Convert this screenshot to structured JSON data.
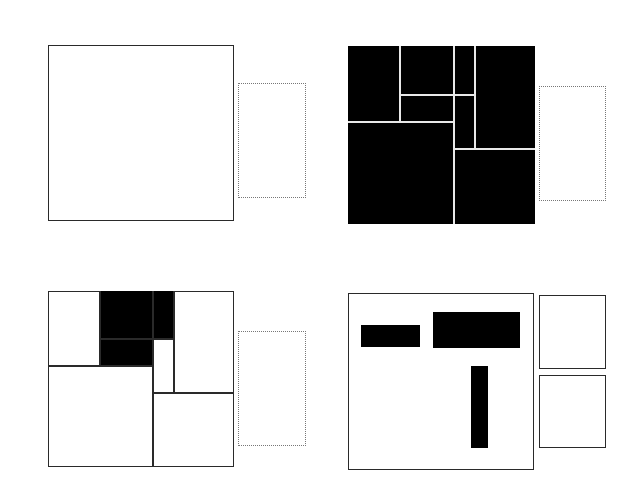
{
  "colors": {
    "background": "#ffffff",
    "stroke": "#2a2a2a",
    "fill": "#000000",
    "divider_on_black": "#e8e8e8",
    "dotted": "#777777"
  },
  "panels": [
    {
      "id": "top-left",
      "description": "empty square with dotted rectangle",
      "frame": {
        "x": 48,
        "y": 45,
        "w": 186,
        "h": 176,
        "style": "outline"
      },
      "side": [
        {
          "x": 238,
          "y": 83,
          "w": 68,
          "h": 115,
          "style": "dotted"
        }
      ]
    },
    {
      "id": "top-right",
      "description": "fully filled square partitioned into cells",
      "frame": {
        "x": 348,
        "y": 46,
        "w": 187,
        "h": 178,
        "style": "filled"
      },
      "dividers": [
        {
          "x1": 400,
          "y1": 46,
          "x2": 400,
          "y2": 122
        },
        {
          "x1": 454,
          "y1": 46,
          "x2": 454,
          "y2": 224
        },
        {
          "x1": 475,
          "y1": 46,
          "x2": 475,
          "y2": 149
        },
        {
          "x1": 400,
          "y1": 95,
          "x2": 475,
          "y2": 95
        },
        {
          "x1": 348,
          "y1": 122,
          "x2": 454,
          "y2": 122
        },
        {
          "x1": 454,
          "y1": 149,
          "x2": 535,
          "y2": 149
        }
      ],
      "side": [
        {
          "x": 539,
          "y": 86,
          "w": 67,
          "h": 115,
          "style": "dotted"
        }
      ]
    },
    {
      "id": "bottom-left",
      "description": "partitioned square with some cells filled",
      "frame": {
        "x": 48,
        "y": 291,
        "w": 186,
        "h": 176,
        "style": "outline"
      },
      "dividers": [
        {
          "x1": 100,
          "y1": 291,
          "x2": 100,
          "y2": 366
        },
        {
          "x1": 153,
          "y1": 291,
          "x2": 153,
          "y2": 467
        },
        {
          "x1": 174,
          "y1": 291,
          "x2": 174,
          "y2": 393
        },
        {
          "x1": 100,
          "y1": 339,
          "x2": 174,
          "y2": 339
        },
        {
          "x1": 48,
          "y1": 366,
          "x2": 153,
          "y2": 366
        },
        {
          "x1": 153,
          "y1": 393,
          "x2": 234,
          "y2": 393
        }
      ],
      "filled_cells": [
        {
          "x": 100,
          "y": 291,
          "w": 53,
          "h": 48
        },
        {
          "x": 153,
          "y": 291,
          "w": 21,
          "h": 48
        },
        {
          "x": 100,
          "y": 339,
          "w": 53,
          "h": 27
        }
      ],
      "side": [
        {
          "x": 238,
          "y": 331,
          "w": 68,
          "h": 115,
          "style": "dotted"
        }
      ]
    },
    {
      "id": "bottom-right",
      "description": "outline frame with three black bars and two side boxes",
      "frame": {
        "x": 348,
        "y": 293,
        "w": 186,
        "h": 177,
        "style": "outline"
      },
      "bars": [
        {
          "x": 361,
          "y": 325,
          "w": 59,
          "h": 22
        },
        {
          "x": 433,
          "y": 312,
          "w": 87,
          "h": 36
        },
        {
          "x": 471,
          "y": 366,
          "w": 17,
          "h": 82
        }
      ],
      "side": [
        {
          "x": 539,
          "y": 295,
          "w": 67,
          "h": 74,
          "style": "solid"
        },
        {
          "x": 539,
          "y": 375,
          "w": 67,
          "h": 73,
          "style": "solid"
        }
      ]
    }
  ]
}
